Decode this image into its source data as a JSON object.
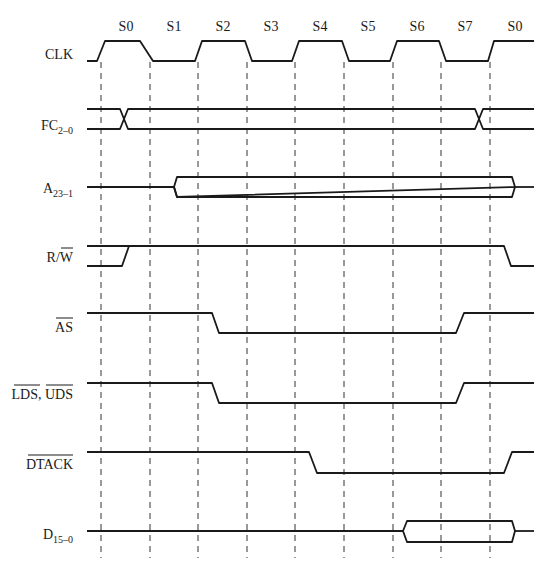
{
  "diagram": {
    "type": "timing-diagram",
    "states": [
      "S0",
      "S1",
      "S2",
      "S3",
      "S4",
      "S5",
      "S6",
      "S7",
      "S0"
    ],
    "signals": [
      {
        "id": "clk",
        "label": "CLK",
        "subscript": "",
        "overbar": false
      },
      {
        "id": "fc",
        "label": "FC",
        "subscript": "2–0",
        "overbar": false
      },
      {
        "id": "addr",
        "label": "A",
        "subscript": "23–1",
        "overbar": false
      },
      {
        "id": "rw",
        "label_plain": "R/",
        "label_bar": "W",
        "overbar_part": "W"
      },
      {
        "id": "as",
        "label": "AS",
        "overbar": true
      },
      {
        "id": "lds_uds",
        "label_a": "LDS",
        "sep": ", ",
        "label_b": "UDS",
        "overbar": true
      },
      {
        "id": "dtack",
        "label": "DTACK",
        "overbar": true
      },
      {
        "id": "data",
        "label": "D",
        "subscript": "15–0",
        "overbar": false
      }
    ],
    "colors": {
      "line": "#1a1a1a",
      "background": "#ffffff"
    }
  }
}
